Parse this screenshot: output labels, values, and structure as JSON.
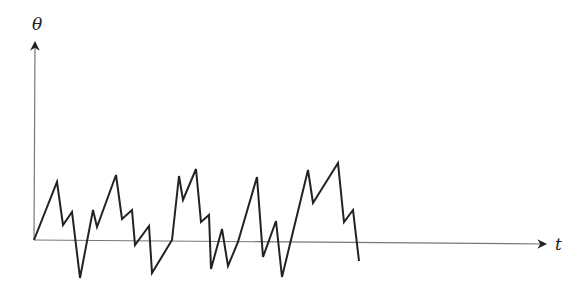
{
  "chart_data": {
    "type": "line",
    "title": "",
    "xlabel": "t",
    "ylabel": "θ",
    "grid": false,
    "legend": null,
    "axes": {
      "origin": [
        34,
        240
      ],
      "x_axis_end": [
        548,
        244
      ],
      "y_axis_end": [
        35,
        40
      ]
    },
    "series": [
      {
        "name": "theta(t)",
        "color": "#222222",
        "points_px": [
          [
            34,
            240
          ],
          [
            57,
            182
          ],
          [
            63,
            225
          ],
          [
            72,
            212
          ],
          [
            80,
            278
          ],
          [
            93,
            210
          ],
          [
            97,
            227
          ],
          [
            116,
            175
          ],
          [
            122,
            219
          ],
          [
            132,
            210
          ],
          [
            135,
            245
          ],
          [
            149,
            226
          ],
          [
            152,
            273
          ],
          [
            172,
            240
          ],
          [
            179,
            176
          ],
          [
            183,
            200
          ],
          [
            196,
            169
          ],
          [
            201,
            222
          ],
          [
            209,
            215
          ],
          [
            211,
            269
          ],
          [
            222,
            229
          ],
          [
            228,
            266
          ],
          [
            238,
            242
          ],
          [
            257,
            177
          ],
          [
            263,
            257
          ],
          [
            276,
            221
          ],
          [
            282,
            277
          ],
          [
            308,
            170
          ],
          [
            313,
            203
          ],
          [
            338,
            163
          ],
          [
            344,
            222
          ],
          [
            353,
            210
          ],
          [
            359,
            261
          ]
        ]
      }
    ]
  },
  "labels": {
    "y_axis": "θ",
    "x_axis": "t"
  },
  "colors": {
    "line": "#222222",
    "axis": "#666666"
  }
}
